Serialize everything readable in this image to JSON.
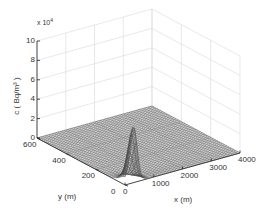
{
  "chart_data": {
    "type": "surface",
    "title": "",
    "xlabel": "x (m)",
    "ylabel": "y (m)",
    "zlabel": "c ( Bq/m³ )",
    "z_multiplier": "x 10⁴",
    "xlim": [
      0,
      4000
    ],
    "ylim": [
      0,
      600
    ],
    "zlim": [
      0,
      10
    ],
    "x_ticks": [
      "0",
      "1000",
      "2000",
      "3000",
      "4000"
    ],
    "y_ticks": [
      "0",
      "200",
      "400",
      "600"
    ],
    "z_ticks": [
      "0",
      "2",
      "4",
      "6",
      "8",
      "10"
    ],
    "grid": true,
    "mesh_color": "#555555",
    "peak": {
      "x": 300,
      "y": 0,
      "z": 5.2
    }
  },
  "labels": {
    "multiplier": "x 10",
    "multiplier_exp": "4",
    "zlabel": "c (  Bq/m³  )",
    "xlabel": "x (m)",
    "ylabel": "y (m)"
  }
}
